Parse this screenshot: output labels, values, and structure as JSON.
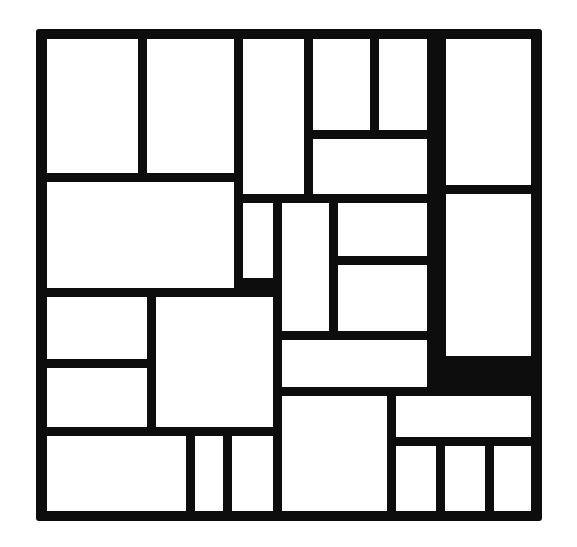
{
  "figure": {
    "type": "geometric-partition",
    "background_color": "#ffffff",
    "line_color": "#0d0d0d",
    "fill_color": "#ffffff",
    "canvas_width": 577,
    "canvas_height": 547,
    "stroke_width": 9,
    "corner_radius": 3,
    "frame": {
      "x": 36,
      "y": 29,
      "w": 506,
      "h": 492
    },
    "cell_count": 28,
    "cells": [
      {
        "id": "r1",
        "label": "",
        "x": 47,
        "y": 39,
        "w": 91,
        "h": 134
      },
      {
        "id": "r2",
        "label": "",
        "x": 147,
        "y": 39,
        "w": 87,
        "h": 134
      },
      {
        "id": "r3",
        "label": "",
        "x": 243,
        "y": 39,
        "w": 61,
        "h": 155
      },
      {
        "id": "r4",
        "label": "",
        "x": 313,
        "y": 39,
        "w": 57,
        "h": 91
      },
      {
        "id": "r5",
        "label": "",
        "x": 379,
        "y": 39,
        "w": 48,
        "h": 91
      },
      {
        "id": "r6",
        "label": "",
        "x": 446,
        "y": 39,
        "w": 85,
        "h": 146
      },
      {
        "id": "r7",
        "label": "",
        "x": 313,
        "y": 139,
        "w": 114,
        "h": 55
      },
      {
        "id": "r8",
        "label": "",
        "x": 47,
        "y": 182,
        "w": 187,
        "h": 106
      },
      {
        "id": "r9",
        "label": "",
        "x": 243,
        "y": 203,
        "w": 30,
        "h": 75
      },
      {
        "id": "r10",
        "label": "",
        "x": 282,
        "y": 203,
        "w": 47,
        "h": 128
      },
      {
        "id": "r11",
        "label": "",
        "x": 338,
        "y": 203,
        "w": 89,
        "h": 53
      },
      {
        "id": "r12",
        "label": "",
        "x": 338,
        "y": 265,
        "w": 89,
        "h": 66
      },
      {
        "id": "r13",
        "label": "",
        "x": 446,
        "y": 194,
        "w": 85,
        "h": 162
      },
      {
        "id": "r14",
        "label": "",
        "x": 47,
        "y": 297,
        "w": 100,
        "h": 62
      },
      {
        "id": "r15",
        "label": "",
        "x": 156,
        "y": 297,
        "w": 117,
        "h": 130
      },
      {
        "id": "r16",
        "label": "",
        "x": 282,
        "y": 340,
        "w": 145,
        "h": 47
      },
      {
        "id": "r17",
        "label": "",
        "x": 47,
        "y": 368,
        "w": 100,
        "h": 59
      },
      {
        "id": "r18",
        "label": "",
        "x": 282,
        "y": 396,
        "w": 105,
        "h": 115
      },
      {
        "id": "r19",
        "label": "",
        "x": 396,
        "y": 396,
        "w": 135,
        "h": 41
      },
      {
        "id": "r20",
        "label": "",
        "x": 47,
        "y": 436,
        "w": 139,
        "h": 75
      },
      {
        "id": "r21",
        "label": "",
        "x": 195,
        "y": 436,
        "w": 28,
        "h": 75
      },
      {
        "id": "r22",
        "label": "",
        "x": 232,
        "y": 436,
        "w": 41,
        "h": 75
      },
      {
        "id": "r23",
        "label": "",
        "x": 396,
        "y": 446,
        "w": 40,
        "h": 65
      },
      {
        "id": "r24",
        "label": "",
        "x": 445,
        "y": 446,
        "w": 40,
        "h": 65
      },
      {
        "id": "r25",
        "label": "",
        "x": 494,
        "y": 446,
        "w": 37,
        "h": 65
      }
    ]
  }
}
